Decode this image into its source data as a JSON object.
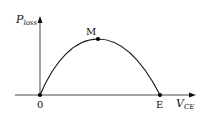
{
  "diagram": {
    "type": "power-loss-curve",
    "y_axis": {
      "label_main": "P",
      "label_sub": "loss"
    },
    "x_axis": {
      "label_main": "V",
      "label_sub": "CE"
    },
    "points": {
      "origin": {
        "label": "0"
      },
      "max": {
        "label": "M"
      },
      "end": {
        "label": "E"
      }
    },
    "colors": {
      "line": "#111111",
      "background": "#ffffff"
    }
  }
}
